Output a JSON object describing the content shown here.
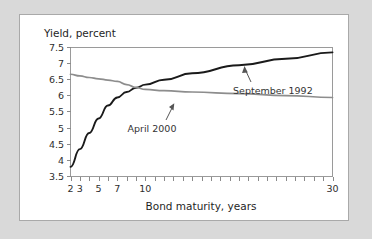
{
  "chart_data": {
    "type": "line",
    "title": "Yield, percent",
    "xlabel": "Bond maturity, years",
    "ylabel": "Yield, percent",
    "ylim": [
      3.5,
      7.5
    ],
    "ytick_labels": [
      "7.5",
      "7",
      "6.5",
      "6",
      "5.5",
      "5",
      "4.5",
      "4",
      "3.5"
    ],
    "ytick_values": [
      7.5,
      7,
      6.5,
      6,
      5.5,
      5,
      4.5,
      4,
      3.5
    ],
    "xlim": [
      2,
      30
    ],
    "x_scale": "ordinal-years",
    "xtick_values": [
      2,
      3,
      4,
      5,
      6,
      7,
      8,
      9,
      10,
      11,
      12,
      13,
      14,
      15,
      16,
      17,
      18,
      19,
      20,
      21,
      22,
      23,
      24,
      25,
      26,
      27,
      28,
      29,
      30
    ],
    "xtick_labeled": [
      {
        "value": 2,
        "label": "2"
      },
      {
        "value": 3,
        "label": "3"
      },
      {
        "value": 5,
        "label": "5"
      },
      {
        "value": 7,
        "label": "7"
      },
      {
        "value": 10,
        "label": "10"
      },
      {
        "value": 30,
        "label": "30"
      }
    ],
    "grid": false,
    "legend_position": "inline-annotations",
    "series": [
      {
        "name": "September 1992",
        "color": "#1a1a1a",
        "x": [
          2,
          3,
          4,
          5,
          6,
          7,
          8,
          9,
          10,
          12,
          15,
          20,
          25,
          30
        ],
        "values": [
          3.8,
          4.35,
          4.85,
          5.3,
          5.7,
          5.95,
          6.12,
          6.25,
          6.35,
          6.5,
          6.7,
          6.95,
          7.15,
          7.35
        ]
      },
      {
        "name": "April 2000",
        "color": "#8d8d8d",
        "x": [
          2,
          3,
          4,
          5,
          6,
          7,
          8,
          9,
          10,
          12,
          15,
          20,
          25,
          30
        ],
        "values": [
          6.67,
          6.62,
          6.57,
          6.53,
          6.49,
          6.45,
          6.35,
          6.26,
          6.2,
          6.16,
          6.12,
          6.07,
          6.01,
          5.95
        ]
      }
    ],
    "annotations": [
      {
        "text": "September 1992",
        "series": "September 1992"
      },
      {
        "text": "April 2000",
        "series": "April 2000"
      }
    ]
  }
}
